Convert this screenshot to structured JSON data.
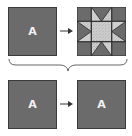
{
  "diagram": {
    "top_row": {
      "source": {
        "label": "A",
        "fill": "#6b6b6b"
      },
      "arrow": "right-arrow",
      "result": {
        "label": "",
        "pattern": "eight-point-star-quilt-block",
        "dark": "#6b6b6b",
        "light": "#d4d4d4"
      }
    },
    "brace": "curly-brace-down",
    "bottom_row": {
      "source": {
        "label": "A",
        "fill": "#6b6b6b"
      },
      "arrow": "right-arrow",
      "result": {
        "label": "A",
        "fill": "#6b6b6b"
      }
    }
  }
}
